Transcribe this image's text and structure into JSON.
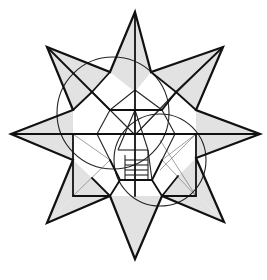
{
  "diagram": {
    "width": 267,
    "height": 280,
    "colors": {
      "background": "#ffffff",
      "fill_shaded": "#e2e2e2",
      "stroke_bold": "#111111",
      "stroke_thin": "#222222",
      "stroke_faint": "#777777"
    },
    "star_outline": [
      [
        135,
        12
      ],
      [
        151,
        72
      ],
      [
        223,
        47
      ],
      [
        196,
        110
      ],
      [
        260,
        134
      ],
      [
        196,
        158
      ],
      [
        224,
        222
      ],
      [
        162,
        196
      ],
      [
        135,
        259
      ],
      [
        110,
        196
      ],
      [
        47,
        223
      ],
      [
        73,
        160
      ],
      [
        11,
        134
      ],
      [
        73,
        110
      ],
      [
        47,
        47
      ],
      [
        110,
        72
      ]
    ],
    "shaded_regions": [
      [
        [
          135,
          12
        ],
        [
          151,
          72
        ],
        [
          135,
          92
        ]
      ],
      [
        [
          135,
          12
        ],
        [
          110,
          72
        ],
        [
          135,
          92
        ]
      ],
      [
        [
          223,
          47
        ],
        [
          196,
          110
        ],
        [
          176,
          92
        ]
      ],
      [
        [
          223,
          47
        ],
        [
          151,
          72
        ],
        [
          176,
          92
        ]
      ],
      [
        [
          260,
          134
        ],
        [
          196,
          110
        ],
        [
          196,
          134
        ]
      ],
      [
        [
          260,
          134
        ],
        [
          196,
          158
        ],
        [
          196,
          134
        ]
      ],
      [
        [
          224,
          222
        ],
        [
          196,
          158
        ],
        [
          178,
          176
        ]
      ],
      [
        [
          224,
          222
        ],
        [
          162,
          196
        ],
        [
          178,
          176
        ]
      ],
      [
        [
          135,
          259
        ],
        [
          162,
          196
        ],
        [
          135,
          196
        ]
      ],
      [
        [
          135,
          259
        ],
        [
          110,
          196
        ],
        [
          135,
          196
        ]
      ],
      [
        [
          47,
          223
        ],
        [
          110,
          196
        ],
        [
          92,
          178
        ]
      ],
      [
        [
          47,
          223
        ],
        [
          73,
          160
        ],
        [
          92,
          178
        ]
      ],
      [
        [
          11,
          134
        ],
        [
          73,
          160
        ],
        [
          73,
          134
        ]
      ],
      [
        [
          11,
          134
        ],
        [
          73,
          110
        ],
        [
          73,
          134
        ]
      ],
      [
        [
          47,
          47
        ],
        [
          73,
          110
        ],
        [
          92,
          92
        ]
      ],
      [
        [
          47,
          47
        ],
        [
          110,
          72
        ],
        [
          92,
          92
        ]
      ]
    ],
    "bold_lines": [
      [
        135,
        12,
        135,
        196
      ],
      [
        11,
        134,
        196,
        134
      ],
      [
        260,
        134,
        196,
        134
      ],
      [
        47,
        47,
        92,
        92
      ],
      [
        223,
        47,
        176,
        92
      ],
      [
        73,
        110,
        92,
        92
      ],
      [
        110,
        72,
        92,
        92
      ],
      [
        151,
        72,
        176,
        92
      ],
      [
        196,
        110,
        176,
        92
      ],
      [
        92,
        92,
        110,
        110
      ],
      [
        176,
        92,
        162,
        110
      ],
      [
        110,
        110,
        162,
        110
      ],
      [
        73,
        134,
        73,
        196
      ],
      [
        73,
        196,
        110,
        196
      ],
      [
        196,
        134,
        196,
        196
      ],
      [
        196,
        196,
        162,
        196
      ],
      [
        110,
        196,
        120,
        180
      ],
      [
        162,
        196,
        152,
        180
      ],
      [
        120,
        180,
        152,
        180
      ],
      [
        120,
        180,
        110,
        160
      ],
      [
        152,
        180,
        162,
        160
      ],
      [
        92,
        178,
        110,
        196
      ],
      [
        178,
        176,
        162,
        196
      ]
    ],
    "thin_lines": [
      [
        92,
        92,
        135,
        135
      ],
      [
        176,
        92,
        135,
        135
      ],
      [
        110,
        110,
        135,
        90
      ],
      [
        162,
        110,
        135,
        90
      ],
      [
        110,
        110,
        97,
        134
      ],
      [
        162,
        110,
        175,
        134
      ],
      [
        97,
        134,
        110,
        160
      ],
      [
        175,
        134,
        162,
        160
      ],
      [
        110,
        160,
        120,
        180
      ],
      [
        162,
        160,
        152,
        180
      ],
      [
        118,
        150,
        135,
        110
      ],
      [
        118,
        150,
        148,
        150
      ],
      [
        148,
        150,
        135,
        110
      ],
      [
        148,
        150,
        152,
        180
      ],
      [
        125,
        160,
        148,
        160
      ],
      [
        125,
        165,
        148,
        165
      ],
      [
        125,
        170,
        148,
        170
      ],
      [
        125,
        175,
        148,
        175
      ],
      [
        125,
        155,
        125,
        180
      ],
      [
        148,
        150,
        148,
        180
      ]
    ],
    "faint_lines": [
      [
        47,
        47,
        135,
        135
      ],
      [
        223,
        47,
        135,
        135
      ],
      [
        73,
        134,
        110,
        160
      ],
      [
        73,
        196,
        110,
        160
      ],
      [
        196,
        134,
        162,
        160
      ],
      [
        196,
        196,
        162,
        160
      ],
      [
        160,
        140,
        196,
        196
      ],
      [
        160,
        170,
        196,
        134
      ]
    ],
    "circles": [
      {
        "cx": 113,
        "cy": 113,
        "r": 56
      },
      {
        "cx": 160,
        "cy": 160,
        "r": 46
      }
    ]
  }
}
